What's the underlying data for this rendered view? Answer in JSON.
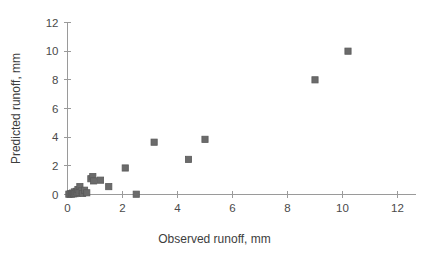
{
  "chart_data": {
    "type": "scatter",
    "title": "",
    "xlabel": "Observed runoff, mm",
    "ylabel": "Predicted runoff, mm",
    "xlim": [
      0,
      12
    ],
    "ylim": [
      0,
      12
    ],
    "xticks": [
      0,
      2,
      4,
      6,
      8,
      10,
      12
    ],
    "yticks": [
      0,
      2,
      4,
      6,
      8,
      10,
      12
    ],
    "xtick_labels": [
      "0",
      "2",
      "4",
      "6",
      "8",
      "10",
      "12"
    ],
    "ytick_labels": [
      "0",
      "2",
      "4",
      "6",
      "8",
      "10",
      "12"
    ],
    "grid": false,
    "legend": false,
    "marker_shape": "square",
    "marker_color": "#6b6b6b",
    "marker_edge_color": "#5a5a5a",
    "axis_color": "#9a9a9a",
    "background_color": "#ffffff",
    "series": [
      {
        "name": "Predicted vs observed runoff",
        "points": [
          [
            0.05,
            0.02
          ],
          [
            0.1,
            0.05
          ],
          [
            0.15,
            0.03
          ],
          [
            0.18,
            0.1
          ],
          [
            0.22,
            0.05
          ],
          [
            0.25,
            0.18
          ],
          [
            0.28,
            0.06
          ],
          [
            0.32,
            0.22
          ],
          [
            0.35,
            0.1
          ],
          [
            0.38,
            0.35
          ],
          [
            0.42,
            0.15
          ],
          [
            0.45,
            0.55
          ],
          [
            0.5,
            0.25
          ],
          [
            0.55,
            0.08
          ],
          [
            0.62,
            0.3
          ],
          [
            0.7,
            0.12
          ],
          [
            0.85,
            1.1
          ],
          [
            0.92,
            1.25
          ],
          [
            0.95,
            0.95
          ],
          [
            1.2,
            1.0
          ],
          [
            1.5,
            0.55
          ],
          [
            2.1,
            1.85
          ],
          [
            2.5,
            0.02
          ],
          [
            3.15,
            3.65
          ],
          [
            4.4,
            2.45
          ],
          [
            5.0,
            3.85
          ],
          [
            9.0,
            8.0
          ],
          [
            10.2,
            10.0
          ]
        ]
      }
    ]
  }
}
